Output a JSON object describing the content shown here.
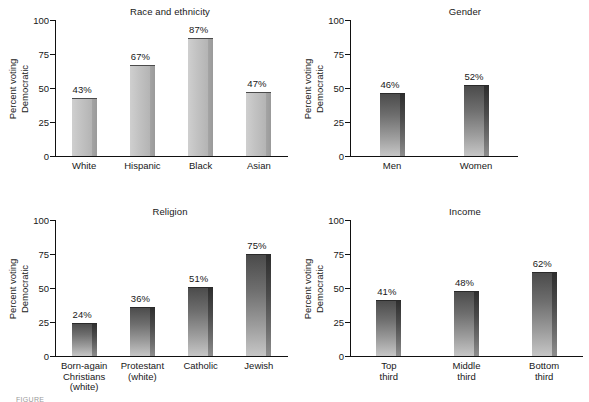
{
  "figure": {
    "caption_partial": "FIGURE",
    "ylabel_line1": "Percent voting",
    "ylabel_line2": "Democratic",
    "yticks": [
      "0",
      "25",
      "50",
      "75",
      "100"
    ]
  },
  "chart_data": [
    {
      "type": "bar",
      "title": "Race and ethnicity",
      "xlabel": "",
      "ylabel": "Percent voting Democratic",
      "ylim": [
        0,
        100
      ],
      "yticks": [
        0,
        25,
        50,
        75,
        100
      ],
      "grid": false,
      "legend": "none",
      "categories": [
        "White",
        "Hispanic",
        "Black",
        "Asian"
      ],
      "values": [
        43,
        67,
        87,
        47
      ],
      "data_labels": [
        "43%",
        "67%",
        "87%",
        "47%"
      ],
      "bar_style": "light-gray"
    },
    {
      "type": "bar",
      "title": "Gender",
      "xlabel": "",
      "ylabel": "Percent voting Democratic",
      "ylim": [
        0,
        100
      ],
      "yticks": [
        0,
        25,
        50,
        75,
        100
      ],
      "grid": false,
      "legend": "none",
      "categories": [
        "Men",
        "Women"
      ],
      "values": [
        46,
        52
      ],
      "data_labels": [
        "46%",
        "52%"
      ],
      "bar_style": "dark-gradient"
    },
    {
      "type": "bar",
      "title": "Religion",
      "xlabel": "",
      "ylabel": "Percent voting Democratic",
      "ylim": [
        0,
        100
      ],
      "yticks": [
        0,
        25,
        50,
        75,
        100
      ],
      "grid": false,
      "legend": "none",
      "categories": [
        "Born-again Christians (white)",
        "Protestant (white)",
        "Catholic",
        "Jewish"
      ],
      "category_lines": [
        [
          "Born-again",
          "Christians",
          "(white)"
        ],
        [
          "Protestant",
          "(white)"
        ],
        [
          "Catholic"
        ],
        [
          "Jewish"
        ]
      ],
      "values": [
        24,
        36,
        51,
        75
      ],
      "data_labels": [
        "24%",
        "36%",
        "51%",
        "75%"
      ],
      "bar_style": "dark-gradient"
    },
    {
      "type": "bar",
      "title": "Income",
      "xlabel": "",
      "ylabel": "Percent voting Democratic",
      "ylim": [
        0,
        100
      ],
      "yticks": [
        0,
        25,
        50,
        75,
        100
      ],
      "grid": false,
      "legend": "none",
      "categories": [
        "Top third",
        "Middle third",
        "Bottom third"
      ],
      "category_lines": [
        [
          "Top",
          "third"
        ],
        [
          "Middle",
          "third"
        ],
        [
          "Bottom",
          "third"
        ]
      ],
      "values": [
        41,
        48,
        62
      ],
      "data_labels": [
        "41%",
        "48%",
        "62%"
      ],
      "bar_style": "dark-gradient"
    }
  ]
}
